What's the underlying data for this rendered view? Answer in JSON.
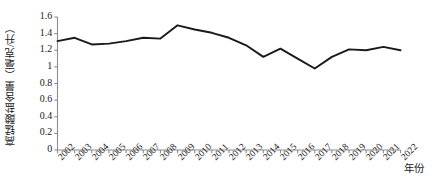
{
  "chart_data": {
    "type": "line",
    "title": "",
    "xlabel": "年份",
    "ylabel": "高锰酸盐含量（毫克/升）",
    "x": [
      2002,
      2003,
      2004,
      2005,
      2006,
      2007,
      2008,
      2009,
      2010,
      2011,
      2012,
      2013,
      2014,
      2015,
      2016,
      2017,
      2018,
      2019,
      2020,
      2021,
      2022
    ],
    "xticklabels": [
      "2002",
      "2003",
      "2004",
      "2005",
      "2006",
      "2007",
      "2008",
      "2009",
      "2010",
      "2011",
      "2012",
      "2013",
      "2014",
      "2015",
      "2016",
      "2017",
      "2018",
      "2019",
      "2020",
      "2021",
      "2022"
    ],
    "values": [
      1.31,
      1.35,
      1.27,
      1.28,
      1.31,
      1.35,
      1.34,
      1.5,
      1.45,
      1.41,
      1.35,
      1.26,
      1.12,
      1.22,
      1.1,
      0.98,
      1.12,
      1.21,
      1.2,
      1.24,
      1.2
    ],
    "yticks": [
      0,
      0.2,
      0.4,
      0.6,
      0.8,
      1,
      1.2,
      1.4,
      1.6
    ],
    "yticklabels": [
      "0",
      "0.2",
      "0.4",
      "0.6",
      "0.8",
      "1",
      "1.2",
      "1.4",
      "1.6"
    ],
    "ylim": [
      0,
      1.6
    ],
    "xlim": [
      2002,
      2022
    ],
    "grid": false,
    "legend": false,
    "series": [
      {
        "name": "高锰酸盐含量",
        "color": "#1a1a1a",
        "values": [
          1.31,
          1.35,
          1.27,
          1.28,
          1.31,
          1.35,
          1.34,
          1.5,
          1.45,
          1.41,
          1.35,
          1.26,
          1.12,
          1.22,
          1.1,
          0.98,
          1.12,
          1.21,
          1.2,
          1.24,
          1.2
        ]
      }
    ],
    "axis_color": "#8c8c8c",
    "line_color": "#1a1a1a"
  }
}
